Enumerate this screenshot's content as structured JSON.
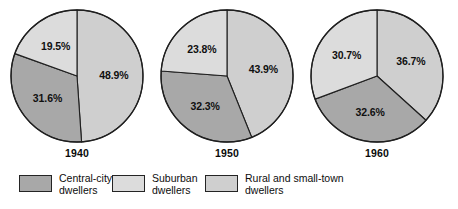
{
  "chart_data": {
    "type": "pie",
    "title": "",
    "subtitle": "",
    "xlabel": "",
    "ylabel": "",
    "legend_position": "bottom",
    "grid": false,
    "unit": "%",
    "categories": [
      "Central-city dwellers",
      "Suburban dwellers",
      "Rural and small-town dwellers"
    ],
    "colors": [
      "#a8a8a8",
      "#dcdcdc",
      "#cfcfcf"
    ],
    "charts": [
      {
        "year": "1940",
        "slices": [
          {
            "category": "Rural and small-town dwellers",
            "value": 48.9,
            "label": "48.9%",
            "color": "#cfcfcf"
          },
          {
            "category": "Central-city dwellers",
            "value": 31.6,
            "label": "31.6%",
            "color": "#a8a8a8"
          },
          {
            "category": "Suburban dwellers",
            "value": 19.5,
            "label": "19.5%",
            "color": "#dcdcdc"
          }
        ]
      },
      {
        "year": "1950",
        "slices": [
          {
            "category": "Rural and small-town dwellers",
            "value": 43.9,
            "label": "43.9%",
            "color": "#cfcfcf"
          },
          {
            "category": "Central-city dwellers",
            "value": 32.3,
            "label": "32.3%",
            "color": "#a8a8a8"
          },
          {
            "category": "Suburban dwellers",
            "value": 23.8,
            "label": "23.8%",
            "color": "#dcdcdc"
          }
        ]
      },
      {
        "year": "1960",
        "slices": [
          {
            "category": "Rural and small-town dwellers",
            "value": 36.7,
            "label": "36.7%",
            "color": "#cfcfcf"
          },
          {
            "category": "Central-city dwellers",
            "value": 32.6,
            "label": "32.6%",
            "color": "#a8a8a8"
          },
          {
            "category": "Suburban dwellers",
            "value": 30.7,
            "label": "30.7%",
            "color": "#dcdcdc"
          }
        ]
      }
    ]
  },
  "charts_display": [
    {
      "year": "1940",
      "labels": [
        "48.9%",
        "31.6%",
        "19.5%"
      ]
    },
    {
      "year": "1950",
      "labels": [
        "43.9%",
        "32.3%",
        "23.8%"
      ]
    },
    {
      "year": "1960",
      "labels": [
        "36.7%",
        "32.6%",
        "30.7%"
      ]
    }
  ],
  "legend": {
    "items": [
      {
        "name": "central-city",
        "line1": "Central-city",
        "line2": "dwellers",
        "color": "#a8a8a8"
      },
      {
        "name": "suburban",
        "line1": "Suburban",
        "line2": "dwellers",
        "color": "#dcdcdc"
      },
      {
        "name": "rural-small-town",
        "line1": "Rural and small-town",
        "line2": "dwellers",
        "color": "#cfcfcf"
      }
    ]
  }
}
